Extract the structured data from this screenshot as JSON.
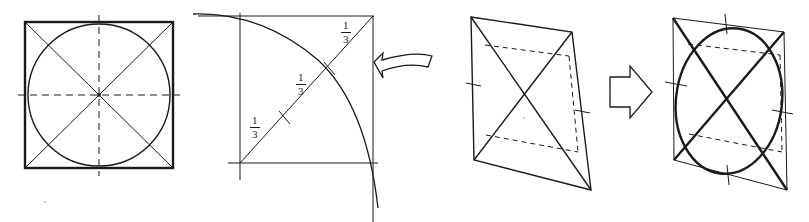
{
  "canvas": {
    "width": 809,
    "height": 222,
    "background": "#ffffff",
    "ink_color": "#1a1a1a",
    "title": "Inscribing an ellipse in a parallelogram — four-step construction"
  },
  "figures": [
    {
      "id": "fig-1",
      "name": "square-with-inscribed-circle",
      "caption": "",
      "elements": [
        "square outline",
        "inscribed circle",
        "two diagonals",
        "horizontal dashed median",
        "vertical dashed median",
        "center point"
      ]
    },
    {
      "id": "fig-2",
      "name": "quarter-arc-trisection-construction",
      "caption": "",
      "elements": [
        "vertical axis",
        "horizontal baseline",
        "right vertical edge",
        "top edge",
        "quarter circle arc",
        "trisected diagonal with tick marks",
        "curved fold arrow"
      ],
      "labels": [
        {
          "id": "frac-upper",
          "text_numerator": "1",
          "text_denominator": "3",
          "x": 346,
          "y": 25
        },
        {
          "id": "frac-middle",
          "text_numerator": "1",
          "text_denominator": "3",
          "x": 301,
          "y": 77
        },
        {
          "id": "frac-lower",
          "text_numerator": "1",
          "text_denominator": "3",
          "x": 255,
          "y": 120
        }
      ]
    },
    {
      "id": "fig-3",
      "name": "parallelogram-projection",
      "caption": "",
      "elements": [
        "parallelogram outline",
        "two diagonals",
        "dashed upper median",
        "dashed lower median",
        "dashed vertical median",
        "edge midpoint tick marks"
      ]
    },
    {
      "id": "fig-4",
      "name": "parallelogram-with-inscribed-ellipse",
      "caption": "",
      "elements": [
        "parallelogram outline",
        "two diagonals",
        "inscribed ellipse",
        "dashed upper median",
        "dashed lower median",
        "dashed vertical median",
        "edge midpoint tick marks"
      ]
    }
  ],
  "connectors": [
    {
      "id": "block-arrow",
      "name": "right-block-arrow",
      "direction": "right",
      "style": "hollow outline",
      "x": 608,
      "y": 72
    },
    {
      "id": "fold-arrow",
      "name": "curved-fold-arrow",
      "direction": "left",
      "style": "hollow curved banner",
      "x": 363,
      "y": 44
    }
  ],
  "fraction_labels": {
    "numerator": "1",
    "denominator": "3",
    "count": 3,
    "meaning": "each of the three equal segments of the diagonal"
  }
}
